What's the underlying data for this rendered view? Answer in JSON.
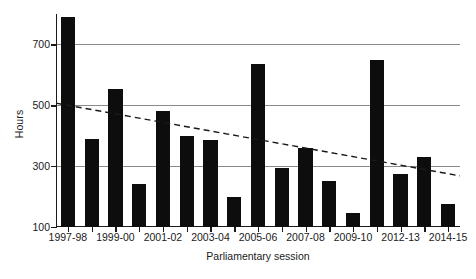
{
  "chart_data": {
    "type": "bar",
    "title": "",
    "xlabel": "Parliamentary session",
    "ylabel": "Hours",
    "ylim": [
      100,
      800
    ],
    "yticks": [
      100,
      300,
      500,
      700
    ],
    "grid": true,
    "legend": "none",
    "categories": [
      "1997-98",
      "1998-99",
      "1999-00",
      "2000-01",
      "2001-02",
      "2002-03",
      "2003-04",
      "2004-05",
      "2005-06",
      "2006-07",
      "2007-08",
      "2008-09",
      "2009-10",
      "2010-12",
      "2012-13",
      "2013-14",
      "2014-15"
    ],
    "tick_labels": [
      "1997-98",
      "1999-00",
      "2001-02",
      "2003-04",
      "2005-06",
      "2007-08",
      "2009-10",
      "2012-13",
      "2014-15"
    ],
    "values": [
      790,
      390,
      555,
      240,
      480,
      400,
      385,
      200,
      635,
      295,
      360,
      250,
      145,
      650,
      275,
      330,
      175
    ],
    "series": [
      {
        "name": "Hours",
        "values": [
          790,
          390,
          555,
          240,
          480,
          400,
          385,
          200,
          635,
          295,
          360,
          250,
          145,
          650,
          275,
          330,
          175
        ]
      }
    ],
    "trendline": {
      "type": "linear",
      "style": "dashed",
      "start_value": 507,
      "end_value": 268
    },
    "colors": {
      "bar": "#0d0d0d",
      "gridline": "#8a8a8a",
      "axis": "#1a1a1a",
      "trendline": "#1a1a1a"
    }
  }
}
